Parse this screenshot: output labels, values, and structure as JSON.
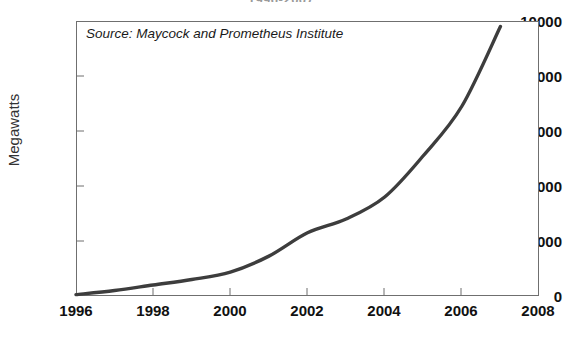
{
  "chart_data": {
    "type": "line",
    "title": "1996-2007",
    "xlabel": "",
    "ylabel": "Megawatts",
    "xlim": [
      1996,
      2008
    ],
    "ylim": [
      0,
      10000
    ],
    "xticks": [
      1996,
      1998,
      2000,
      2002,
      2004,
      2006,
      2008
    ],
    "xtick_labels": [
      "1996",
      "1998",
      "2000",
      "2002",
      "2004",
      "2006",
      "2008"
    ],
    "yticks": [
      0,
      2000,
      4000,
      6000,
      8000,
      10000
    ],
    "ytick_labels": [
      "0",
      "2000",
      "4000",
      "6000",
      "8000",
      "10000"
    ],
    "grid": false,
    "legend": null,
    "annotations": [
      {
        "name": "source-note",
        "text": "Source: Maycock and Prometheus Institute"
      }
    ],
    "series": [
      {
        "name": "Solar PV production",
        "color": "#3d3d3d",
        "x": [
          1996,
          1997,
          1998,
          1999,
          2000,
          2001,
          2002,
          2003,
          2004,
          2005,
          2006,
          2007
        ],
        "values": [
          90,
          130,
          155,
          200,
          280,
          390,
          560,
          760,
          1195,
          1815,
          2520,
          3800
        ]
      }
    ],
    "curve_pixels": {
      "note": "cumulative curve read off the plot",
      "x": [
        1996,
        1997,
        1998,
        1999,
        2000,
        2001,
        2002,
        2003,
        2004,
        2005,
        2006,
        2007
      ],
      "values": [
        50,
        200,
        400,
        600,
        870,
        1450,
        2300,
        2800,
        3600,
        5100,
        6900,
        9800
      ]
    }
  },
  "axes": {
    "ylabel": "Megawatts"
  }
}
